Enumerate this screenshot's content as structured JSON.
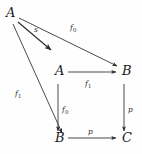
{
  "diagram": {
    "kind": "commutative-diagram",
    "background_color": "#fefefe",
    "ink_color": "#2b2b2b",
    "nodes": [
      {
        "id": "a-top-left",
        "label": "A",
        "x": 6,
        "y": 14
      },
      {
        "id": "a-middle",
        "label": "A",
        "x": 55,
        "y": 76
      },
      {
        "id": "b-middle-right",
        "label": "B",
        "x": 124,
        "y": 76
      },
      {
        "id": "b-bottom-left",
        "label": "B",
        "x": 55,
        "y": 142
      },
      {
        "id": "c-bottom-right",
        "label": "C",
        "x": 124,
        "y": 142
      }
    ],
    "edges": [
      {
        "id": "edge-s",
        "label": "s",
        "sub": "",
        "from": "a-top-left",
        "to": "a-middle",
        "label_x": 36,
        "label_y": 30
      },
      {
        "id": "edge-f0-diagonal",
        "label": "f",
        "sub": "0",
        "from": "a-top-left",
        "to": "b-middle-right",
        "label_x": 72,
        "label_y": 28
      },
      {
        "id": "edge-f1-diagonal",
        "label": "f",
        "sub": "1",
        "from": "a-top-left",
        "to": "b-bottom-left",
        "label_x": 18,
        "label_y": 94
      },
      {
        "id": "edge-f1-top",
        "label": "f",
        "sub": "1",
        "from": "a-middle",
        "to": "b-middle-right",
        "label_x": 86,
        "label_y": 88
      },
      {
        "id": "edge-f0-left",
        "label": "f",
        "sub": "0",
        "from": "a-middle",
        "to": "b-bottom-left",
        "label_x": 63,
        "label_y": 112
      },
      {
        "id": "edge-p-right",
        "label": "p",
        "sub": "",
        "from": "b-middle-right",
        "to": "c-bottom-right",
        "label_x": 129,
        "label_y": 112
      },
      {
        "id": "edge-p-bottom",
        "label": "p",
        "sub": "",
        "from": "b-bottom-left",
        "to": "c-bottom-right",
        "label_x": 89,
        "label_y": 134
      }
    ]
  }
}
